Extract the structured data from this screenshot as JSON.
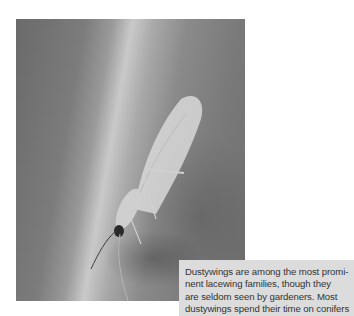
{
  "figure": {
    "image_alt": "Dustywing insect on a leaf surface",
    "caption_lines": [
      "Dustywings are among the most promi-",
      "nent lacewing families, though they",
      "are seldom seen by gardeners. Most",
      "dustywings spend their time on conifers"
    ]
  },
  "colors": {
    "caption_bg": "#dcdcdc",
    "caption_text": "#333333"
  }
}
